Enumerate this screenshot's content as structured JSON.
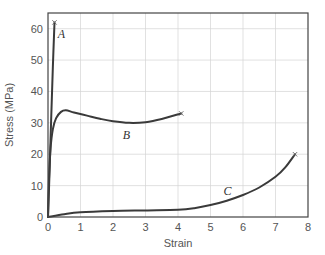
{
  "chart_data": {
    "type": "line",
    "title": "",
    "xlabel": "Strain",
    "ylabel": "Stress (MPa)",
    "xlim": [
      0,
      8
    ],
    "ylim": [
      0,
      65
    ],
    "x_ticks": [
      0,
      1,
      2,
      3,
      4,
      5,
      6,
      7,
      8
    ],
    "y_ticks": [
      0,
      10,
      20,
      30,
      40,
      50,
      60
    ],
    "grid": true,
    "legend": null,
    "fracture_marker": "×",
    "series": [
      {
        "name": "A",
        "label_position": [
          0.3,
          57
        ],
        "points": [
          [
            0,
            0
          ],
          [
            0.05,
            15
          ],
          [
            0.1,
            32
          ],
          [
            0.15,
            48
          ],
          [
            0.2,
            62
          ]
        ],
        "fracture_point": [
          0.2,
          62
        ]
      },
      {
        "name": "B",
        "label_position": [
          2.3,
          25
        ],
        "points": [
          [
            0,
            0
          ],
          [
            0.03,
            12
          ],
          [
            0.08,
            22
          ],
          [
            0.15,
            28
          ],
          [
            0.25,
            31.5
          ],
          [
            0.4,
            33.5
          ],
          [
            0.55,
            34
          ],
          [
            0.8,
            33.3
          ],
          [
            1.2,
            32.3
          ],
          [
            1.6,
            31.3
          ],
          [
            2.0,
            30.5
          ],
          [
            2.5,
            30
          ],
          [
            3.0,
            30.2
          ],
          [
            3.5,
            31.2
          ],
          [
            4.1,
            33
          ]
        ],
        "fracture_point": [
          4.1,
          33
        ]
      },
      {
        "name": "C",
        "label_position": [
          5.4,
          7
        ],
        "points": [
          [
            0,
            0
          ],
          [
            0.5,
            0.9
          ],
          [
            1.0,
            1.5
          ],
          [
            2.0,
            1.9
          ],
          [
            3.0,
            2.1
          ],
          [
            4.0,
            2.3
          ],
          [
            4.5,
            2.8
          ],
          [
            5.0,
            3.8
          ],
          [
            5.5,
            5.2
          ],
          [
            6.0,
            7.0
          ],
          [
            6.5,
            9.4
          ],
          [
            7.0,
            12.8
          ],
          [
            7.3,
            15.8
          ],
          [
            7.6,
            20
          ]
        ],
        "fracture_point": [
          7.6,
          20
        ]
      }
    ]
  },
  "colors": {
    "curve": "#3a3a3a",
    "grid": "#d4d4d4",
    "frame": "#444444",
    "text": "#555555"
  }
}
